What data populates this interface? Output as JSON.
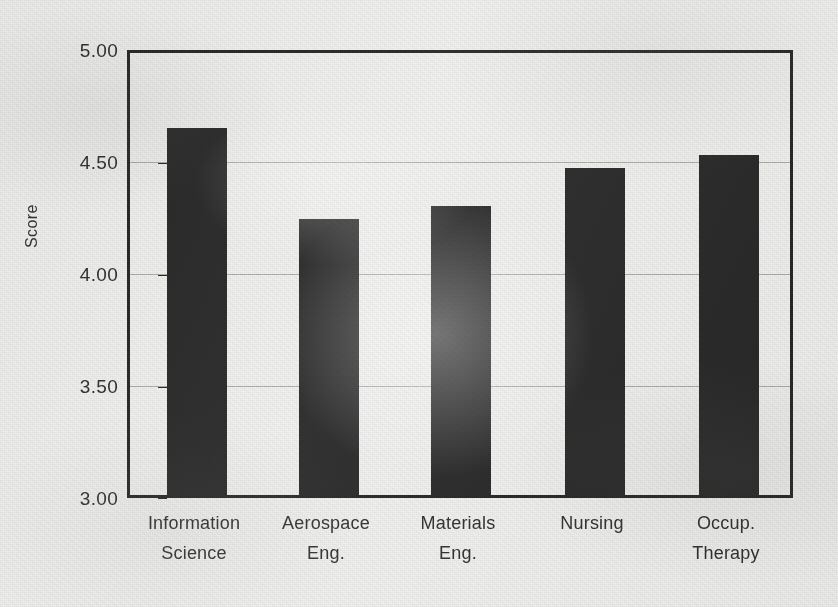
{
  "chart_data": {
    "type": "bar",
    "title": "",
    "xlabel": "",
    "ylabel": "Score",
    "categories": [
      "Information Science",
      "Aerospace Eng.",
      "Materials Eng.",
      "Nursing",
      "Occup. Therapy"
    ],
    "category_lines": [
      [
        "Information",
        "Science"
      ],
      [
        "Aerospace",
        "Eng."
      ],
      [
        "Materials",
        "Eng."
      ],
      [
        "Nursing",
        ""
      ],
      [
        "Occup.",
        "Therapy"
      ]
    ],
    "values": [
      4.64,
      4.23,
      4.29,
      4.46,
      4.52
    ],
    "ylim": [
      3.0,
      5.0
    ],
    "yticks": [
      5.0,
      4.5,
      4.0,
      3.5,
      3.0
    ],
    "ytick_labels": [
      "5.00",
      "4.50",
      "4.00",
      "3.50",
      "3.00"
    ],
    "grid": true,
    "gridlines_at": [
      4.5,
      4.0,
      3.5
    ],
    "legend": null,
    "bar_color": "#1c1c1c",
    "axis_color": "#1a1a1a",
    "grid_color": "#a9a9a6",
    "background_color": "#f1f1ef"
  }
}
